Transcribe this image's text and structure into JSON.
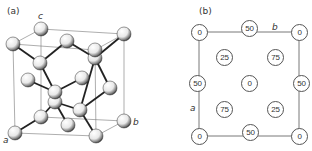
{
  "panel_a": {
    "label": "(a)",
    "axes": {
      "a": "a",
      "b": "b",
      "c": "c"
    },
    "description": "Diamond-cubic unit cell, perspective view with atoms as spheres and bonds"
  },
  "panel_b": {
    "label": "(b)",
    "axes": {
      "a": "a",
      "b": "b"
    },
    "description": "Plan view projected along c; numbers give atom heights as % of c",
    "sites": [
      {
        "id": "corner-tl",
        "height": "0"
      },
      {
        "id": "edge-top",
        "height": "50"
      },
      {
        "id": "corner-tr",
        "height": "0"
      },
      {
        "id": "inner-ul",
        "height": "25"
      },
      {
        "id": "inner-ur",
        "height": "75"
      },
      {
        "id": "edge-left",
        "height": "50"
      },
      {
        "id": "center",
        "height": "0"
      },
      {
        "id": "edge-right",
        "height": "50"
      },
      {
        "id": "inner-ll",
        "height": "75"
      },
      {
        "id": "inner-lr",
        "height": "25"
      },
      {
        "id": "corner-bl",
        "height": "0"
      },
      {
        "id": "edge-bottom",
        "height": "50"
      },
      {
        "id": "corner-br",
        "height": "0"
      }
    ]
  }
}
